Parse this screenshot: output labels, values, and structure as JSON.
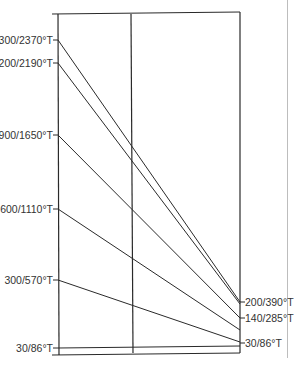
{
  "chart_data": {
    "type": "line",
    "title": "",
    "xlabel": "",
    "ylabel": "",
    "grid": false,
    "axes": [
      {
        "name": "left",
        "x": 58
      },
      {
        "name": "middle",
        "x": 131
      },
      {
        "name": "right",
        "x": 240
      }
    ],
    "left_labels": [
      {
        "text": "300/2370°T",
        "y": 40
      },
      {
        "text": "1200/2190°T",
        "y": 63
      },
      {
        "text": "900/1650°T",
        "y": 135
      },
      {
        "text": "600/1110°T",
        "y": 209
      },
      {
        "text": "300/570°T",
        "y": 280
      },
      {
        "text": "30/86°T",
        "y": 348
      }
    ],
    "right_labels": [
      {
        "text": "200/390°T",
        "y": 302
      },
      {
        "text": "140/285°T",
        "y": 318
      },
      {
        "text": "30/86°T",
        "y": 343
      }
    ],
    "series": [
      {
        "name": "300/2370°T",
        "start_y": 40,
        "end_y": 302
      },
      {
        "name": "1200/2190°T",
        "start_y": 63,
        "end_y": 304
      },
      {
        "name": "900/1650°T",
        "start_y": 135,
        "end_y": 318
      },
      {
        "name": "600/1110°T",
        "start_y": 209,
        "end_y": 330
      },
      {
        "name": "300/570°T",
        "start_y": 280,
        "end_y": 342
      },
      {
        "name": "30/86°T",
        "start_y": 348,
        "end_y": 346
      }
    ]
  }
}
